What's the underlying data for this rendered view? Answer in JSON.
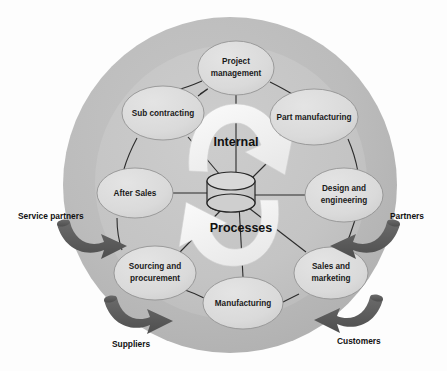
{
  "diagram": {
    "center": {
      "line1": "Internal",
      "line2": "Processes",
      "icon": "database-cylinder-icon"
    },
    "colors": {
      "background": "#fdfdfd",
      "outer_ring": "#b9b9b9",
      "inner_disc": "#c3c3c3",
      "node_fill": "#dcdcdc",
      "node_stroke": "#8d8d8d",
      "cycle_arrow": "#f4f4f4",
      "external_arrow": "#5a5a5a",
      "text": "#111111"
    },
    "nodes": [
      {
        "id": "project-management",
        "label_line1": "Project",
        "label_line2": "management",
        "cx": 236,
        "cy": 68,
        "rx": 38,
        "ry": 27
      },
      {
        "id": "part-manufacturing",
        "label_line1": "Part manufacturing",
        "label_line2": "",
        "cx": 314,
        "cy": 117,
        "rx": 44,
        "ry": 28
      },
      {
        "id": "design-and-engineering",
        "label_line1": "Design and",
        "label_line2": "engineering",
        "cx": 344,
        "cy": 195,
        "rx": 39,
        "ry": 27
      },
      {
        "id": "sales-and-marketing",
        "label_line1": "Sales and",
        "label_line2": "marketing",
        "cx": 331,
        "cy": 273,
        "rx": 37,
        "ry": 26
      },
      {
        "id": "manufacturing",
        "label_line1": "Manufacturing",
        "label_line2": "",
        "cx": 243,
        "cy": 303,
        "rx": 40,
        "ry": 26
      },
      {
        "id": "sourcing-and-procurement",
        "label_line1": "Sourcing and",
        "label_line2": "procurement",
        "cx": 155,
        "cy": 273,
        "rx": 41,
        "ry": 27
      },
      {
        "id": "after-sales",
        "label_line1": "After Sales",
        "label_line2": "",
        "cx": 135,
        "cy": 193,
        "rx": 38,
        "ry": 25
      },
      {
        "id": "sub-contracting",
        "label_line1": "Sub contracting",
        "label_line2": "",
        "cx": 163,
        "cy": 113,
        "rx": 41,
        "ry": 27
      }
    ],
    "external_labels": [
      {
        "id": "service-partners",
        "text": "Service partners",
        "x": 18,
        "y": 217,
        "anchor": "start"
      },
      {
        "id": "partners",
        "text": "Partners",
        "x": 390,
        "y": 217,
        "anchor": "start"
      },
      {
        "id": "suppliers",
        "text": "Suppliers",
        "x": 112,
        "y": 345,
        "anchor": "start"
      },
      {
        "id": "customers",
        "text": "Customers",
        "x": 337,
        "y": 342,
        "anchor": "start"
      }
    ],
    "external_arrows": [
      {
        "id": "service-partners-arrow",
        "direction": "inward"
      },
      {
        "id": "partners-arrow",
        "direction": "inward"
      },
      {
        "id": "suppliers-arrow",
        "direction": "inward"
      },
      {
        "id": "customers-arrow",
        "direction": "inward"
      }
    ],
    "cycle_arrows": [
      {
        "id": "top-cycle-arrow",
        "direction": "clockwise-top"
      },
      {
        "id": "bottom-cycle-arrow",
        "direction": "clockwise-bottom"
      }
    ]
  }
}
